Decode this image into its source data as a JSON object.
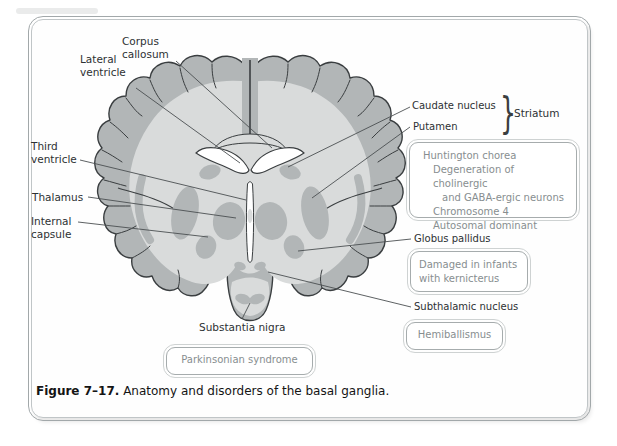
{
  "caption": {
    "label": "Figure 7–17.",
    "text": "Anatomy and disorders of the basal ganglia."
  },
  "anatomy_labels": {
    "corpus_callosum": "Corpus callosum",
    "lateral_ventricle": "Lateral ventricle",
    "third_ventricle": "Third ventricle",
    "thalamus": "Thalamus",
    "internal_capsule": "Internal capsule",
    "caudate_nucleus": "Caudate nucleus",
    "putamen": "Putamen",
    "striatum": "Striatum",
    "globus_pallidus": "Globus pallidus",
    "subthalamic_nucleus": "Subthalamic nucleus",
    "substantia_nigra": "Substantia nigra"
  },
  "brace_glyph": "}",
  "disorder_boxes": {
    "huntington": {
      "line1": "Huntington chorea",
      "line2": "Degeneration of cholinergic",
      "line3": "and GABA-ergic neurons",
      "line4": "Chromosome 4",
      "line5": "Autosomal dominant"
    },
    "kernicterus": {
      "line1": "Damaged in infants",
      "line2": "with kernicterus"
    },
    "hemiballismus": {
      "label": "Hemiballismus"
    },
    "parkinsonian": {
      "label": "Parkinsonian syndrome"
    }
  },
  "colors": {
    "cortex_gray": "#b2b6b7",
    "white_matter_gray": "#d9dbdb",
    "outline": "#3a3e40",
    "leader_line": "#4b4f51",
    "box_border": "#a6acad",
    "box_text": "#878e90",
    "frame_border": "#a2a8aa"
  }
}
